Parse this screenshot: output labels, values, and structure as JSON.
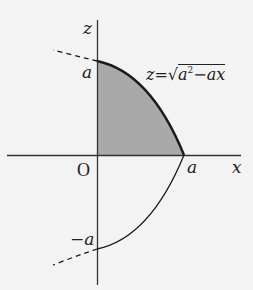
{
  "diagram": {
    "type": "region under parabola",
    "axes": {
      "horizontal_label": "x",
      "vertical_label": "z",
      "origin_label": "O"
    },
    "tick_labels": {
      "z_positive": "a",
      "z_negative": "−a",
      "x_positive": "a"
    },
    "equation": {
      "lhs": "z",
      "eq": "=",
      "radicand_a": "a",
      "radicand_exp": "2",
      "radicand_rest": "−ax"
    },
    "colors": {
      "background": "#f3f3f3",
      "shading": "#a9a9a9",
      "curve": "#1a1a1a",
      "axis": "#333333"
    }
  }
}
